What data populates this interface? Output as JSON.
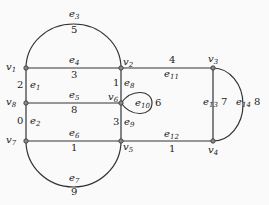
{
  "graph": {
    "nodes": [
      {
        "id": "v1",
        "label": "v",
        "sub": "1",
        "x": 26,
        "y": 68
      },
      {
        "id": "v2",
        "label": "v",
        "sub": "2",
        "x": 121,
        "y": 68
      },
      {
        "id": "v3",
        "label": "v",
        "sub": "3",
        "x": 213,
        "y": 68
      },
      {
        "id": "v4",
        "label": "v",
        "sub": "4",
        "x": 213,
        "y": 141
      },
      {
        "id": "v5",
        "label": "v",
        "sub": "5",
        "x": 121,
        "y": 141
      },
      {
        "id": "v6",
        "label": "v",
        "sub": "6",
        "x": 121,
        "y": 103
      },
      {
        "id": "v7",
        "label": "v",
        "sub": "7",
        "x": 26,
        "y": 141
      },
      {
        "id": "v8",
        "label": "v",
        "sub": "8",
        "x": 26,
        "y": 103
      }
    ],
    "edges": [
      {
        "id": "e1",
        "label": "e",
        "sub": "1",
        "weight": "2",
        "from": "v1",
        "to": "v8"
      },
      {
        "id": "e2",
        "label": "e",
        "sub": "2",
        "weight": "0",
        "from": "v8",
        "to": "v7"
      },
      {
        "id": "e3",
        "label": "e",
        "sub": "3",
        "weight": "5",
        "from": "v1",
        "to": "v2"
      },
      {
        "id": "e4",
        "label": "e",
        "sub": "4",
        "weight": "3",
        "from": "v1",
        "to": "v2"
      },
      {
        "id": "e5",
        "label": "e",
        "sub": "5",
        "weight": "8",
        "from": "v8",
        "to": "v6"
      },
      {
        "id": "e6",
        "label": "e",
        "sub": "6",
        "weight": "1",
        "from": "v7",
        "to": "v5"
      },
      {
        "id": "e7",
        "label": "e",
        "sub": "7",
        "weight": "9",
        "from": "v7",
        "to": "v5"
      },
      {
        "id": "e8",
        "label": "e",
        "sub": "8",
        "weight": "1",
        "from": "v2",
        "to": "v6"
      },
      {
        "id": "e9",
        "label": "e",
        "sub": "9",
        "weight": "3",
        "from": "v6",
        "to": "v5"
      },
      {
        "id": "e10",
        "label": "e",
        "sub": "10",
        "weight": "6",
        "from": "v6",
        "to": "v6"
      },
      {
        "id": "e11",
        "label": "e",
        "sub": "11",
        "weight": "4",
        "from": "v2",
        "to": "v3"
      },
      {
        "id": "e12",
        "label": "e",
        "sub": "12",
        "weight": "1",
        "from": "v5",
        "to": "v4"
      },
      {
        "id": "e13",
        "label": "e",
        "sub": "13",
        "weight": "7",
        "from": "v3",
        "to": "v4"
      },
      {
        "id": "e14",
        "label": "e",
        "sub": "14",
        "weight": "8",
        "from": "v3",
        "to": "v4"
      }
    ]
  }
}
